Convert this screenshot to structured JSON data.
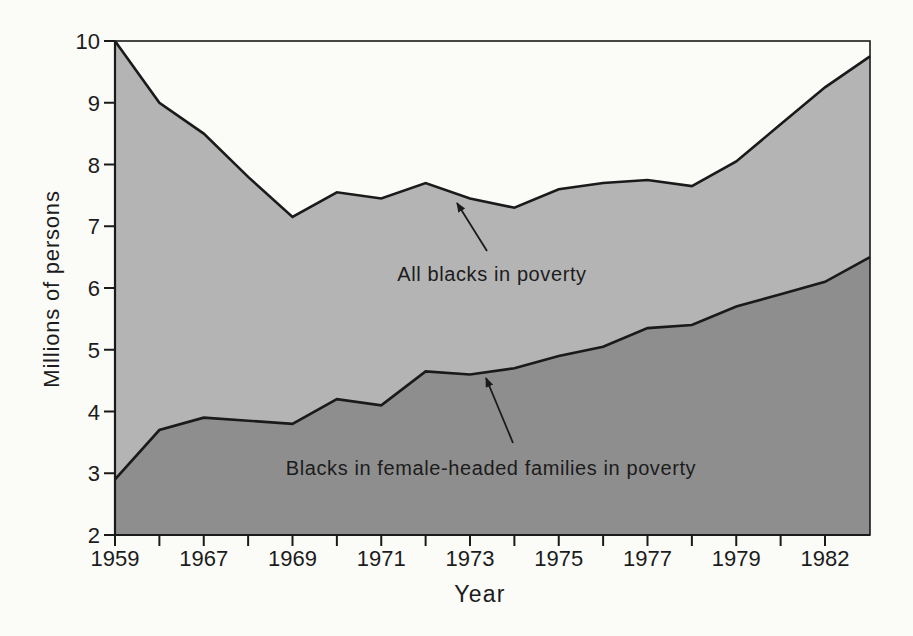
{
  "figure": {
    "background": "#fbfbf8",
    "area_light_color": "#b4b4b4",
    "area_dark_color": "#8e8e8e",
    "line_color": "#1a1a1a",
    "text_color": "#1c1c1c"
  },
  "chart_data": {
    "type": "area",
    "title": "",
    "xlabel": "Year",
    "ylabel": "Millions of persons",
    "ylim": [
      2,
      10
    ],
    "grid": false,
    "legend": "inline-annotations",
    "y_ticks": [
      "2",
      "3",
      "4",
      "5",
      "6",
      "7",
      "8",
      "9",
      "10"
    ],
    "x_tick_labels": [
      "1959",
      "1967",
      "1969",
      "1971",
      "1973",
      "1975",
      "1977",
      "1979",
      "1982"
    ],
    "labeled_tick_indices": [
      0,
      2,
      4,
      6,
      8,
      10,
      12,
      14,
      16
    ],
    "tick_count": 17,
    "years": [
      "1959",
      "1966",
      "1967",
      "1968",
      "1969",
      "1970",
      "1971",
      "1972",
      "1973",
      "1974",
      "1975",
      "1976",
      "1977",
      "1978",
      "1979",
      "1980",
      "1981",
      "1982"
    ],
    "series": [
      {
        "name": "All blacks in poverty",
        "values": [
          10.0,
          9.0,
          8.5,
          7.8,
          7.15,
          7.55,
          7.45,
          7.7,
          7.45,
          7.3,
          7.6,
          7.7,
          7.75,
          7.65,
          8.05,
          8.65,
          9.25,
          9.75
        ]
      },
      {
        "name": "Blacks in female-headed families in poverty",
        "values": [
          2.9,
          3.7,
          3.9,
          3.85,
          3.8,
          4.2,
          4.1,
          4.65,
          4.6,
          4.7,
          4.9,
          5.05,
          5.35,
          5.4,
          5.7,
          5.9,
          6.1,
          6.5
        ]
      }
    ],
    "annotations": [
      {
        "text": "All blacks in poverty",
        "text_x": 492,
        "text_y": 263,
        "arrow_from": [
          487,
          251
        ],
        "arrow_to": [
          457,
          203
        ]
      },
      {
        "text": "Blacks in female-headed families in poverty",
        "text_x": 491,
        "text_y": 457,
        "arrow_from": [
          513,
          443
        ],
        "arrow_to": [
          486,
          378
        ]
      }
    ]
  }
}
